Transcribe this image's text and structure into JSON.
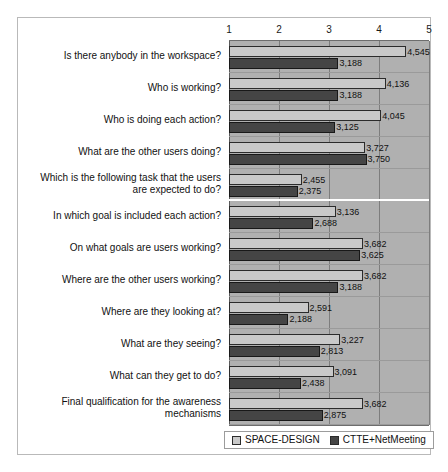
{
  "chart_data": {
    "type": "bar",
    "orientation": "horizontal",
    "title": "",
    "xlabel": "",
    "ylabel": "",
    "xlim": [
      1,
      5
    ],
    "xticks": [
      1,
      2,
      3,
      4,
      5
    ],
    "xtick_labels": [
      "1",
      "2",
      "3",
      "4",
      "5"
    ],
    "grid": true,
    "legend_position": "bottom",
    "categories": [
      "Is there anybody in the workspace?",
      "Who is working?",
      "Who is doing each action?",
      "What are the other users doing?",
      "Which is the following task that the users are expected to do?",
      "In which goal is included each action?",
      "On what goals are users working?",
      "Where are the other users working?",
      "Where are they looking at?",
      "What are they seeing?",
      "What can they get to do?",
      "Final qualification for the awareness mechanisms"
    ],
    "series": [
      {
        "name": "SPACE-DESIGN",
        "color": "#c9c9c9",
        "values": [
          4.545,
          4.136,
          4.045,
          3.727,
          2.455,
          3.136,
          3.682,
          3.682,
          2.591,
          3.227,
          3.091,
          3.682
        ],
        "labels": [
          "4,545",
          "4,136",
          "4,045",
          "3,727",
          "2,455",
          "3,136",
          "3,682",
          "3,682",
          "2,591",
          "3,227",
          "3,091",
          "3,682"
        ]
      },
      {
        "name": "CTTE+NetMeeting",
        "color": "#454545",
        "values": [
          3.188,
          3.188,
          3.125,
          3.75,
          2.375,
          2.688,
          3.625,
          3.188,
          2.188,
          2.813,
          2.438,
          2.875
        ],
        "labels": [
          "3,188",
          "3,188",
          "3,125",
          "3,750",
          "2,375",
          "2,688",
          "3,625",
          "3,188",
          "2,188",
          "2,813",
          "2,438",
          "2,875"
        ]
      }
    ],
    "group_separator_after_index": 4
  },
  "legend": {
    "items": [
      {
        "label": "SPACE-DESIGN",
        "color": "#c9c9c9"
      },
      {
        "label": "CTTE+NetMeeting",
        "color": "#454545"
      }
    ]
  }
}
